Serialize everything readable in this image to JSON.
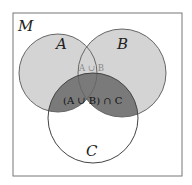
{
  "diagram": {
    "type": "venn",
    "universe_label": "M",
    "sets": [
      {
        "name": "A",
        "label": "A"
      },
      {
        "name": "B",
        "label": "B"
      },
      {
        "name": "C",
        "label": "C"
      }
    ],
    "region_labels": {
      "union_ab": "A ∪ B",
      "union_ab_intersect_c": "(A ∪ B) ∩ C"
    },
    "colors": {
      "background": "#ffffff",
      "frame_stroke": "#777777",
      "circle_stroke": "#666666",
      "union_fill": "#d4d4d4",
      "highlight_fill": "#7a7a7a",
      "union_label_color": "#8a8a8a"
    }
  }
}
